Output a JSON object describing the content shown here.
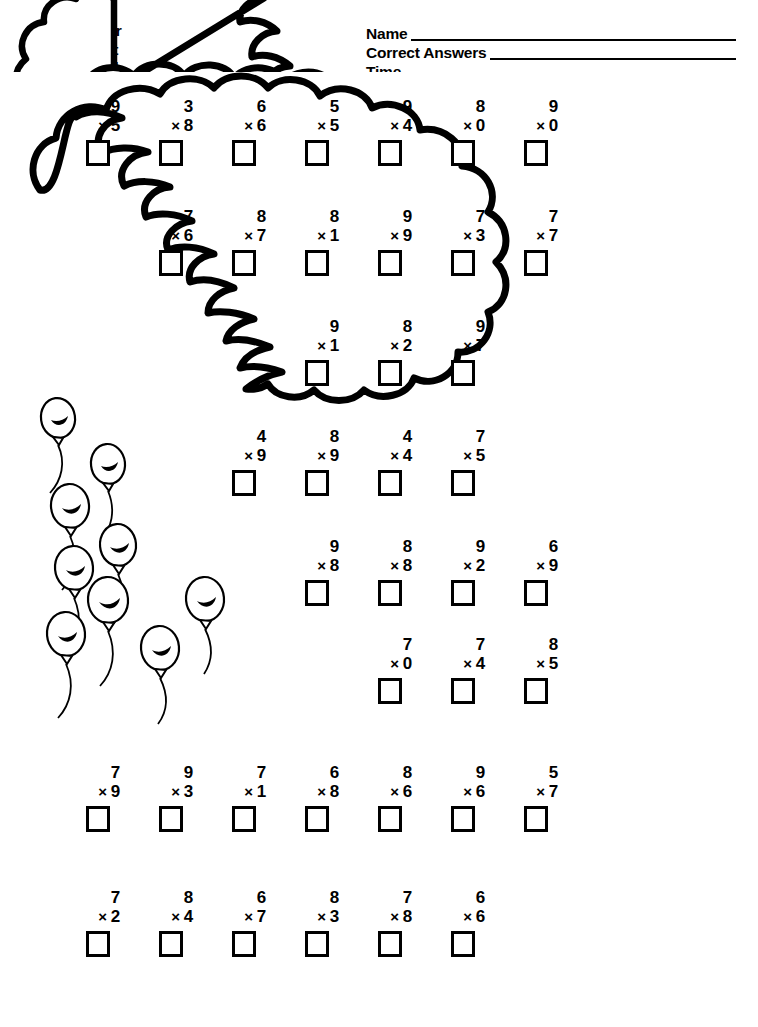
{
  "header": {
    "scoring_key": [
      "36-40 Super",
      "31-35 Great",
      "27-30 Good"
    ],
    "fields": [
      {
        "label": "Name",
        "value": ""
      },
      {
        "label": "Correct Answers",
        "value": ""
      },
      {
        "label": "Time",
        "value": ""
      }
    ]
  },
  "worksheet": {
    "operator_symbol": "×",
    "total_problems": 40,
    "ink_color": "#000000",
    "paper_color": "#ffffff",
    "shape_name": "numeral-3-cloud"
  },
  "rows": [
    {
      "row_id": 1,
      "left": 72,
      "top": 98,
      "step": 73,
      "problems": [
        {
          "top": "9",
          "bottom": "5",
          "answer": ""
        },
        {
          "top": "3",
          "bottom": "8",
          "answer": ""
        },
        {
          "top": "6",
          "bottom": "6",
          "answer": ""
        },
        {
          "top": "5",
          "bottom": "5",
          "answer": ""
        },
        {
          "top": "9",
          "bottom": "4",
          "answer": ""
        },
        {
          "top": "8",
          "bottom": "0",
          "answer": ""
        },
        {
          "top": "9",
          "bottom": "0",
          "answer": ""
        }
      ]
    },
    {
      "row_id": 2,
      "left": 145,
      "top": 208,
      "step": 73,
      "problems": [
        {
          "top": "7",
          "bottom": "6",
          "answer": ""
        },
        {
          "top": "8",
          "bottom": "7",
          "answer": ""
        },
        {
          "top": "8",
          "bottom": "1",
          "answer": ""
        },
        {
          "top": "9",
          "bottom": "9",
          "answer": ""
        },
        {
          "top": "7",
          "bottom": "3",
          "answer": ""
        },
        {
          "top": "7",
          "bottom": "7",
          "answer": ""
        }
      ]
    },
    {
      "row_id": 3,
      "left": 291,
      "top": 318,
      "step": 73,
      "problems": [
        {
          "top": "9",
          "bottom": "1",
          "answer": ""
        },
        {
          "top": "8",
          "bottom": "2",
          "answer": ""
        },
        {
          "top": "9",
          "bottom": "7",
          "answer": ""
        }
      ]
    },
    {
      "row_id": 4,
      "left": 218,
      "top": 428,
      "step": 73,
      "problems": [
        {
          "top": "4",
          "bottom": "9",
          "answer": ""
        },
        {
          "top": "8",
          "bottom": "9",
          "answer": ""
        },
        {
          "top": "4",
          "bottom": "4",
          "answer": ""
        },
        {
          "top": "7",
          "bottom": "5",
          "answer": ""
        }
      ]
    },
    {
      "row_id": 5,
      "left": 291,
      "top": 538,
      "step": 73,
      "problems": [
        {
          "top": "9",
          "bottom": "8",
          "answer": ""
        },
        {
          "top": "8",
          "bottom": "8",
          "answer": ""
        },
        {
          "top": "9",
          "bottom": "2",
          "answer": ""
        },
        {
          "top": "6",
          "bottom": "9",
          "answer": ""
        }
      ]
    },
    {
      "row_id": 6,
      "left": 364,
      "top": 636,
      "step": 73,
      "problems": [
        {
          "top": "7",
          "bottom": "0",
          "answer": ""
        },
        {
          "top": "7",
          "bottom": "4",
          "answer": ""
        },
        {
          "top": "8",
          "bottom": "5",
          "answer": ""
        }
      ]
    },
    {
      "row_id": 7,
      "left": 72,
      "top": 764,
      "step": 73,
      "problems": [
        {
          "top": "7",
          "bottom": "9",
          "answer": ""
        },
        {
          "top": "9",
          "bottom": "3",
          "answer": ""
        },
        {
          "top": "7",
          "bottom": "1",
          "answer": ""
        },
        {
          "top": "6",
          "bottom": "8",
          "answer": ""
        },
        {
          "top": "8",
          "bottom": "6",
          "answer": ""
        },
        {
          "top": "9",
          "bottom": "6",
          "answer": ""
        },
        {
          "top": "5",
          "bottom": "7",
          "answer": ""
        }
      ]
    },
    {
      "row_id": 8,
      "left": 72,
      "top": 889,
      "step": 73,
      "problems": [
        {
          "top": "7",
          "bottom": "2",
          "answer": ""
        },
        {
          "top": "8",
          "bottom": "4",
          "answer": ""
        },
        {
          "top": "6",
          "bottom": "7",
          "answer": ""
        },
        {
          "top": "8",
          "bottom": "3",
          "answer": ""
        },
        {
          "top": "7",
          "bottom": "8",
          "answer": ""
        },
        {
          "top": "6",
          "bottom": "6",
          "answer": ""
        }
      ]
    }
  ],
  "balloons": [
    {
      "cx": 58,
      "cy": 418,
      "rx": 17,
      "ry": 20,
      "rot": -8,
      "string": "M58,441 C64,460 60,478 50,492"
    },
    {
      "cx": 108,
      "cy": 464,
      "rx": 17,
      "ry": 20,
      "rot": -6,
      "string": "M109,487 C116,508 112,528 101,544"
    },
    {
      "cx": 70,
      "cy": 506,
      "rx": 19,
      "ry": 22,
      "rot": -5,
      "string": "M71,531 C78,552 74,572 63,588"
    },
    {
      "cx": 118,
      "cy": 545,
      "rx": 18,
      "ry": 21,
      "rot": -5,
      "string": "M119,569 C126,590 122,610 111,626"
    },
    {
      "cx": 74,
      "cy": 568,
      "rx": 19,
      "ry": 22,
      "rot": -5,
      "string": "M75,593 C82,614 78,634 67,650"
    },
    {
      "cx": 108,
      "cy": 600,
      "rx": 20,
      "ry": 23,
      "rot": -5,
      "string": "M109,626 C116,648 112,668 101,684"
    },
    {
      "cx": 66,
      "cy": 634,
      "rx": 19,
      "ry": 22,
      "rot": -5,
      "string": "M67,659 C74,680 70,700 59,716"
    },
    {
      "cx": 160,
      "cy": 648,
      "rx": 19,
      "ry": 22,
      "rot": -5,
      "string": "M161,673 C168,694 164,714 153,730"
    },
    {
      "cx": 205,
      "cy": 599,
      "rx": 19,
      "ry": 22,
      "rot": -5,
      "string": "M206,624 C213,645 209,665 198,681"
    }
  ]
}
